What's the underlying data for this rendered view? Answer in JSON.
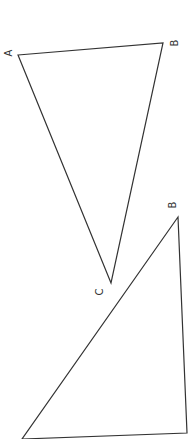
{
  "diagram": {
    "stroke_color": "#333333",
    "background": "#ffffff",
    "triangles": [
      {
        "name": "triangle-abc",
        "vertices": {
          "A": {
            "label": "A",
            "x": 18,
            "y": 55
          },
          "B": {
            "label": "B",
            "x": 163,
            "y": 43
          },
          "C": {
            "label": "C",
            "x": 111,
            "y": 283
          }
        }
      },
      {
        "name": "triangle-second",
        "vertices": {
          "B": {
            "label": "B",
            "x": 178,
            "y": 217
          },
          "bottom_left": {
            "label": "",
            "x": 22,
            "y": 439
          },
          "bottom_right": {
            "label": "",
            "x": 187,
            "y": 433
          }
        }
      }
    ]
  }
}
